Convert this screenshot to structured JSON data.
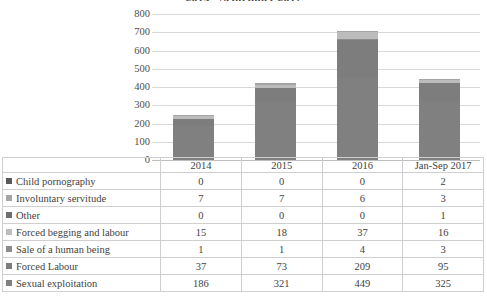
{
  "chart_data": {
    "type": "bar",
    "subtype": "stacked-column",
    "title": "2014 - September 2017",
    "xlabel": "",
    "ylabel": "",
    "ylim": [
      0,
      800
    ],
    "yticks": [
      0,
      100,
      200,
      300,
      400,
      500,
      600,
      700,
      800
    ],
    "grid": true,
    "legend_position": "table-left-column",
    "categories": [
      "2014",
      "2015",
      "2016",
      "Jan-Sep 2017"
    ],
    "series": [
      {
        "name": "Sexual exploitation",
        "values": [
          186,
          321,
          449,
          325
        ],
        "color": "#808080"
      },
      {
        "name": "Forced Labour",
        "values": [
          37,
          73,
          209,
          95
        ],
        "color": "#7d7d7d"
      },
      {
        "name": "Sale of a human being",
        "values": [
          1,
          1,
          4,
          3
        ],
        "color": "#8c8c8c"
      },
      {
        "name": "Forced begging and labour",
        "values": [
          15,
          18,
          37,
          16
        ],
        "color": "#bcbcbc"
      },
      {
        "name": "Other",
        "values": [
          0,
          0,
          0,
          1
        ],
        "color": "#6e6e6e"
      },
      {
        "name": "Involuntary servitude",
        "values": [
          7,
          7,
          6,
          3
        ],
        "color": "#a5a5a5"
      },
      {
        "name": "Child pornography",
        "values": [
          0,
          0,
          0,
          2
        ],
        "color": "#5a5a5a"
      }
    ],
    "totals": [
      246,
      421,
      706,
      445
    ]
  },
  "table": {
    "header": [
      "",
      "2014",
      "2015",
      "2016",
      "Jan-Sep 2017"
    ],
    "rows": [
      {
        "label": "Child pornography",
        "swatch": "#5a5a5a",
        "values": [
          "0",
          "0",
          "0",
          "2"
        ]
      },
      {
        "label": "Involuntary servitude",
        "swatch": "#a5a5a5",
        "values": [
          "7",
          "7",
          "6",
          "3"
        ]
      },
      {
        "label": "Other",
        "swatch": "#6e6e6e",
        "values": [
          "0",
          "0",
          "0",
          "1"
        ]
      },
      {
        "label": "Forced begging and labour",
        "swatch": "#bcbcbc",
        "values": [
          "15",
          "18",
          "37",
          "16"
        ]
      },
      {
        "label": "Sale of a human being",
        "swatch": "#8c8c8c",
        "values": [
          "1",
          "1",
          "4",
          "3"
        ]
      },
      {
        "label": "Forced Labour",
        "swatch": "#7d7d7d",
        "values": [
          "37",
          "73",
          "209",
          "95"
        ]
      },
      {
        "label": "Sexual exploitation",
        "swatch": "#808080",
        "values": [
          "186",
          "321",
          "449",
          "325"
        ]
      }
    ]
  }
}
